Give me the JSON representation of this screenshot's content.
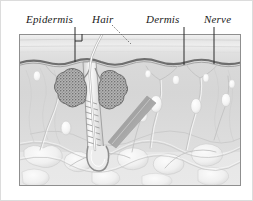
{
  "figure": {
    "labels": [
      {
        "id": "epidermis",
        "text": "Epidermis",
        "leader": "vertical-line"
      },
      {
        "id": "hair",
        "text": "Hair",
        "leader": "dotted-diagonal-line"
      },
      {
        "id": "dermis",
        "text": "Dermis",
        "leader": "vertical-line"
      },
      {
        "id": "nerve",
        "text": "Nerve",
        "leader": "vertical-line"
      }
    ],
    "structures": [
      {
        "name": "epidermis-layer",
        "description": "Light gray banded surface layer"
      },
      {
        "name": "dermal-junction",
        "description": "Dark undulating boundary line"
      },
      {
        "name": "dermis-layer",
        "description": "Pale gray middle layer"
      },
      {
        "name": "subcutaneous-fat",
        "description": "Lobular white fat cell clusters"
      },
      {
        "name": "hair-shaft",
        "description": "Hair emerging above skin surface"
      },
      {
        "name": "hair-follicle",
        "description": "Hatched follicle canal"
      },
      {
        "name": "hair-bulb",
        "description": "Rounded base of follicle"
      },
      {
        "name": "sebaceous-gland-left",
        "description": "Dark stippled lobed gland"
      },
      {
        "name": "sebaceous-gland-right",
        "description": "Dark stippled lobed gland"
      },
      {
        "name": "arrector-pili-muscle",
        "description": "Diagonal gray muscle band"
      },
      {
        "name": "nerve-fibers",
        "description": "Branching fibers with bulb endings"
      }
    ],
    "colors": {
      "page_background": "#ffffff",
      "panel_border": "#9a9a9a",
      "epidermis": "#e3e3e3",
      "dermis": "#d9d9d9",
      "fat": "#efefef",
      "junction_line": "#6b6b6b",
      "gland": "#8c8c8c",
      "label_text": "#1a1a1a",
      "outer_border": "#d8d8d8"
    }
  }
}
